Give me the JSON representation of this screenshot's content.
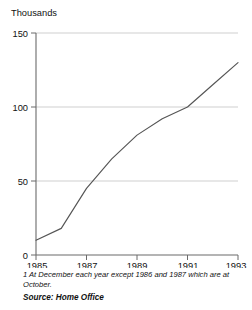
{
  "figure": {
    "clipped_top_fragment": "",
    "unit_label": "Thousands",
    "footnote_line1": "1 At December each year except 1986 and 1987 which are",
    "footnote_line2": "at October.",
    "source": "Source: Home Office"
  },
  "colors": {
    "line": "#555555",
    "axis": "#6b6b6b",
    "grid": "#cfcfcf",
    "text": "#111111",
    "background": "#ffffff"
  },
  "chart_data": {
    "type": "line",
    "title": "",
    "subtitle": "",
    "xlabel": "",
    "ylabel": "Thousands",
    "x": [
      1985,
      1986,
      1987,
      1988,
      1989,
      1990,
      1991,
      1992,
      1993
    ],
    "values": [
      10,
      18,
      45,
      65,
      81,
      92,
      100,
      115,
      130
    ],
    "series": [
      {
        "name": "Thousands",
        "values": [
          10,
          18,
          45,
          65,
          81,
          92,
          100,
          115,
          130
        ]
      }
    ],
    "xlim": [
      1985,
      1993
    ],
    "ylim": [
      0,
      150
    ],
    "xticks": [
      1985,
      1987,
      1989,
      1991,
      1993
    ],
    "xtick_labels": [
      "1985",
      "1987",
      "1989",
      "1991",
      "1993"
    ],
    "yticks": [
      0,
      50,
      100,
      150
    ],
    "ytick_labels": [
      "0",
      "50",
      "100",
      "150"
    ],
    "grid": "horizontal",
    "legend": "none",
    "annotations": [
      "1 At December each year except 1986 and 1987 which are at October.",
      "Source: Home Office"
    ]
  }
}
